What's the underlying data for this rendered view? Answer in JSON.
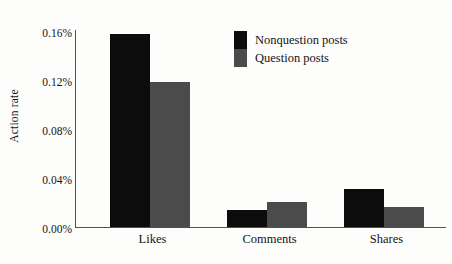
{
  "chart_data": {
    "type": "bar",
    "title": "",
    "subtitle": "",
    "xlabel": "",
    "ylabel": "Action rate",
    "categories": [
      "Likes",
      "Comments",
      "Shares"
    ],
    "series": [
      {
        "name": "Nonquestion posts",
        "color": "#0c0c0c",
        "values": [
          0.157,
          0.014,
          0.031
        ]
      },
      {
        "name": "Question posts",
        "color": "#4b4b4b",
        "values": [
          0.118,
          0.02,
          0.016
        ]
      }
    ],
    "ylim": [
      0,
      0.16
    ],
    "y_ticks": [
      0.0,
      0.04,
      0.08,
      0.12,
      0.16
    ],
    "y_tick_labels": [
      "0.00%",
      "0.04%",
      "0.08%",
      "0.12%",
      "0.16%"
    ],
    "value_unit": "percent",
    "grid": false,
    "legend_position": "upper-center",
    "annotations": []
  },
  "axes": {
    "y_title": "Action rate",
    "y_tick_labels": [
      "0.16%",
      "0.12%",
      "0.08%",
      "0.04%",
      "0.00%"
    ],
    "x_tick_labels": [
      "Likes",
      "Comments",
      "Shares"
    ]
  },
  "legend": {
    "items": [
      {
        "label": "Nonquestion posts",
        "swatch": "black-swatch"
      },
      {
        "label": "Question posts",
        "swatch": "gray-swatch"
      }
    ]
  },
  "colors": {
    "nonquestion": "#0c0c0c",
    "question": "#4b4b4b",
    "axis": "#55504c",
    "background": "#fdfdfc"
  }
}
